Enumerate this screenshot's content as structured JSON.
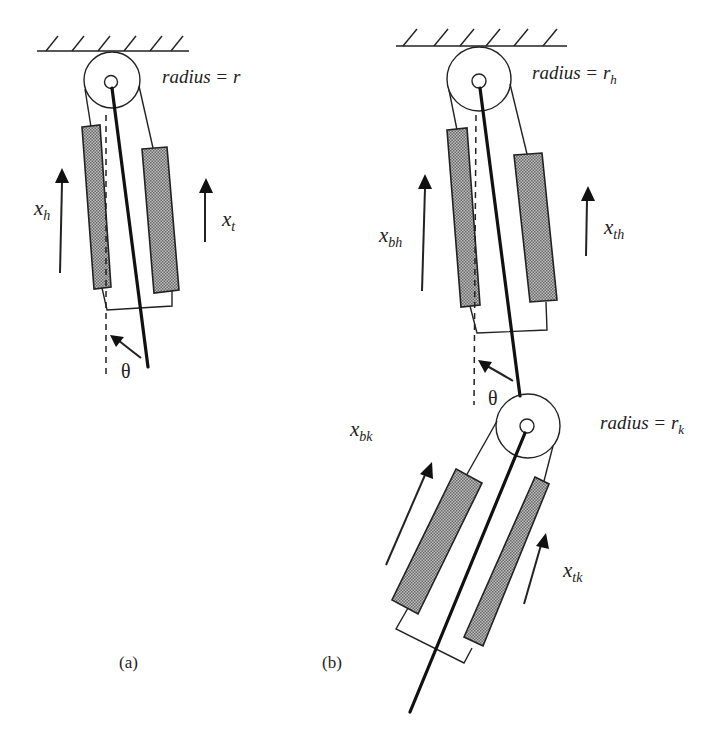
{
  "figure": {
    "panel_a": {
      "caption": "(a)",
      "radius_label": "radius = r",
      "radius_label_main": "radius = ",
      "radius_symbol": "r",
      "radius_subscript": "",
      "arrow_left": {
        "symbol": "x",
        "subscript": "h"
      },
      "arrow_right": {
        "symbol": "x",
        "subscript": "t"
      },
      "angle": "θ"
    },
    "panel_b": {
      "caption": "(b)",
      "hip": {
        "radius_label_main": "radius = ",
        "radius_symbol": "r",
        "radius_subscript": "h",
        "arrow_left": {
          "symbol": "x",
          "subscript": "bh"
        },
        "arrow_right": {
          "symbol": "x",
          "subscript": "th"
        },
        "angle": "θ"
      },
      "knee": {
        "radius_label_main": "radius = ",
        "radius_symbol": "r",
        "radius_subscript": "k",
        "arrow_left": {
          "symbol": "x",
          "subscript": "bk"
        },
        "arrow_right": {
          "symbol": "x",
          "subscript": "tk"
        }
      }
    },
    "colors": {
      "ink": "#222222",
      "muscle_fill_dark": "#6a6a6a",
      "muscle_fill_light": "#bdbdbd",
      "background": "#ffffff"
    }
  }
}
